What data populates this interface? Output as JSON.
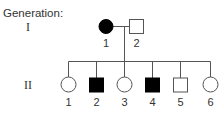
{
  "title": "Generation:",
  "generations": [
    {
      "label": "I",
      "individuals": [
        {
          "number": "1",
          "sex": "female",
          "affected": true
        },
        {
          "number": "2",
          "sex": "male",
          "affected": false
        }
      ]
    },
    {
      "label": "II",
      "individuals": [
        {
          "number": "1",
          "sex": "female",
          "affected": false
        },
        {
          "number": "2",
          "sex": "male",
          "affected": true
        },
        {
          "number": "3",
          "sex": "female",
          "affected": false
        },
        {
          "number": "4",
          "sex": "male",
          "affected": true
        },
        {
          "number": "5",
          "sex": "male",
          "affected": false
        },
        {
          "number": "6",
          "sex": "female",
          "affected": false
        }
      ]
    }
  ],
  "colors": {
    "line": "#555555",
    "affected_fill": "#000000",
    "unaffected_fill": "#ffffff",
    "text": "#333333"
  }
}
